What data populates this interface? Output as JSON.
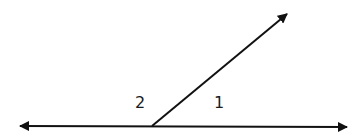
{
  "diagram": {
    "type": "angle-diagram",
    "line_color": "#111111",
    "horizontal_line": {
      "x1": 20,
      "y1": 126,
      "x2": 347,
      "y2": 127,
      "arrows": "both"
    },
    "ray": {
      "x1": 152,
      "y1": 126,
      "x2": 287,
      "y2": 14,
      "arrows": "end"
    },
    "labels": [
      {
        "text": "2",
        "x": 135,
        "y": 95
      },
      {
        "text": "1",
        "x": 214,
        "y": 95
      }
    ]
  }
}
